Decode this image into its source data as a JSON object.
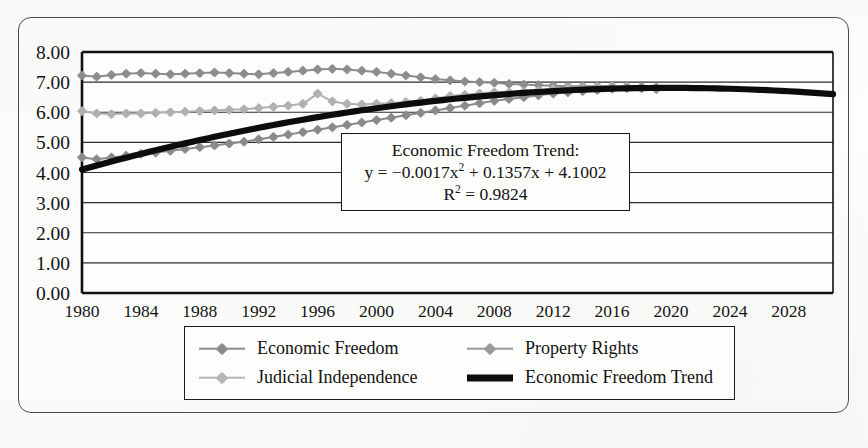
{
  "figure": {
    "background_color": "#fdfdfb",
    "frame_color": "#4a4a52"
  },
  "annotation": {
    "title": "Economic Freedom Trend:",
    "equation_prefix": "y = −0.0017x",
    "equation_exponent": "2",
    "equation_suffix": " + 0.1357x + 4.1002",
    "r_squared_prefix": "R",
    "r_squared_exponent": "2",
    "r_squared_suffix": " = 0.9824"
  },
  "legend": {
    "entries": [
      {
        "label": "Economic Freedom",
        "color": "#8c8c8c",
        "style": "line-marker",
        "marker": "diamond"
      },
      {
        "label": "Property Rights",
        "color": "#9a9a9a",
        "style": "line-marker",
        "marker": "diamond"
      },
      {
        "label": "Judicial Independence",
        "color": "#b4b4b4",
        "style": "line-marker",
        "marker": "diamond"
      },
      {
        "label": "Economic Freedom Trend",
        "color": "#0c0c0c",
        "style": "thick-line",
        "marker": "none"
      }
    ]
  },
  "chart_data": {
    "type": "line",
    "title": "",
    "xlabel": "",
    "ylabel": "",
    "xlim": [
      1980,
      2031
    ],
    "ylim": [
      0.0,
      8.0
    ],
    "ytick_labels": [
      "8.00",
      "7.00",
      "6.00",
      "5.00",
      "4.00",
      "3.00",
      "2.00",
      "1.00",
      "0.00"
    ],
    "ytick_values": [
      8,
      7,
      6,
      5,
      4,
      3,
      2,
      1,
      0
    ],
    "xtick_labels": [
      "1980",
      "1984",
      "1988",
      "1992",
      "1996",
      "2000",
      "2004",
      "2008",
      "2012",
      "2016",
      "2020",
      "2024",
      "2028"
    ],
    "xtick_values": [
      1980,
      1984,
      1988,
      1992,
      1996,
      2000,
      2004,
      2008,
      2012,
      2016,
      2020,
      2024,
      2028
    ],
    "grid": true,
    "grid_axis": "y",
    "legend_position": "below-plot",
    "annotation_text": "Economic Freedom Trend: y = −0.0017x² + 0.1357x + 4.1002, R² = 0.9824",
    "series": [
      {
        "name": "Property Rights",
        "color": "#8c8c8c",
        "marker": "diamond",
        "x": [
          1980,
          1981,
          1982,
          1983,
          1984,
          1985,
          1986,
          1987,
          1988,
          1989,
          1990,
          1991,
          1992,
          1993,
          1994,
          1995,
          1996,
          1997,
          1998,
          1999,
          2000,
          2001,
          2002,
          2003,
          2004,
          2005,
          2006,
          2007,
          2008,
          2009,
          2010,
          2011,
          2012,
          2013,
          2014,
          2015,
          2016,
          2017,
          2018,
          2019
        ],
        "values": [
          7.22,
          7.18,
          7.24,
          7.28,
          7.3,
          7.28,
          7.26,
          7.28,
          7.3,
          7.32,
          7.3,
          7.28,
          7.26,
          7.3,
          7.34,
          7.38,
          7.42,
          7.44,
          7.42,
          7.38,
          7.34,
          7.28,
          7.22,
          7.16,
          7.1,
          7.06,
          7.02,
          7.0,
          6.98,
          6.94,
          6.92,
          6.9,
          6.88,
          6.86,
          6.86,
          6.86,
          6.86,
          6.86,
          6.84,
          6.82
        ]
      },
      {
        "name": "Judicial Independence",
        "color": "#b0b0b0",
        "marker": "diamond",
        "x": [
          1980,
          1981,
          1982,
          1983,
          1984,
          1985,
          1986,
          1987,
          1988,
          1989,
          1990,
          1991,
          1992,
          1993,
          1994,
          1995,
          1996,
          1997,
          1998,
          1999,
          2000,
          2001,
          2002,
          2003,
          2004,
          2005,
          2006,
          2007,
          2008,
          2009,
          2010,
          2011,
          2012,
          2013,
          2014,
          2015,
          2016,
          2017,
          2018,
          2019
        ],
        "values": [
          6.04,
          5.96,
          5.94,
          5.96,
          5.96,
          5.98,
          6.0,
          6.02,
          6.04,
          6.06,
          6.08,
          6.1,
          6.14,
          6.18,
          6.22,
          6.28,
          6.62,
          6.36,
          6.28,
          6.26,
          6.28,
          6.3,
          6.34,
          6.38,
          6.46,
          6.54,
          6.58,
          6.62,
          6.66,
          6.66,
          6.68,
          6.72,
          6.78,
          6.8,
          6.82,
          6.84,
          6.86,
          6.84,
          6.8,
          6.76
        ]
      },
      {
        "name": "Economic Freedom",
        "color": "#8a8a8a",
        "marker": "diamond",
        "x": [
          1980,
          1981,
          1982,
          1983,
          1984,
          1985,
          1986,
          1987,
          1988,
          1989,
          1990,
          1991,
          1992,
          1993,
          1994,
          1995,
          1996,
          1997,
          1998,
          1999,
          2000,
          2001,
          2002,
          2003,
          2004,
          2005,
          2006,
          2007,
          2008,
          2009,
          2010,
          2011,
          2012,
          2013,
          2014,
          2015,
          2016,
          2017,
          2018,
          2019
        ],
        "values": [
          4.5,
          4.44,
          4.5,
          4.56,
          4.62,
          4.66,
          4.72,
          4.78,
          4.84,
          4.9,
          4.96,
          5.02,
          5.1,
          5.18,
          5.26,
          5.34,
          5.42,
          5.5,
          5.58,
          5.66,
          5.74,
          5.82,
          5.9,
          5.98,
          6.06,
          6.14,
          6.22,
          6.3,
          6.38,
          6.44,
          6.5,
          6.56,
          6.62,
          6.66,
          6.7,
          6.74,
          6.78,
          6.8,
          6.8,
          6.78
        ]
      },
      {
        "name": "Economic Freedom Trend",
        "color": "#0c0c0c",
        "marker": "none",
        "type": "polynomial-fit",
        "equation": "y = -0.0017x^2 + 0.1357x + 4.1002",
        "r_squared": 0.9824,
        "x": [
          1980,
          1982,
          1984,
          1986,
          1988,
          1990,
          1992,
          1994,
          1996,
          1998,
          2000,
          2002,
          2004,
          2006,
          2008,
          2010,
          2012,
          2014,
          2016,
          2018,
          2020,
          2022,
          2024,
          2026,
          2028,
          2030,
          2031
        ],
        "values": [
          4.3,
          4.43,
          4.57,
          4.7,
          4.82,
          4.94,
          5.06,
          5.17,
          5.28,
          5.38,
          5.48,
          5.57,
          5.66,
          5.74,
          5.82,
          5.89,
          5.96,
          6.02,
          6.07,
          6.12,
          6.17,
          6.21,
          6.24,
          6.26,
          6.28,
          6.29,
          6.29
        ]
      }
    ]
  }
}
